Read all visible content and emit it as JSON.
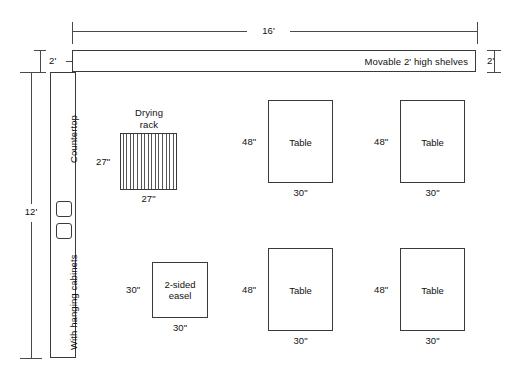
{
  "dimensions": {
    "room_width": "16'",
    "room_depth": "12'",
    "shelf_depth_left": "2'",
    "shelf_depth_right": "2'"
  },
  "shelves": {
    "label": "Movable 2' high shelves"
  },
  "countertop": {
    "top_label": "Countertop",
    "bottom_label": "With hanging cabinets",
    "sinks": [
      {
        "name": "sink-upper"
      },
      {
        "name": "sink-lower"
      }
    ]
  },
  "drying_rack": {
    "label_line1": "Drying",
    "label_line2": "rack",
    "height_label": "27\"",
    "width_label": "27\"",
    "stripe_count": 16
  },
  "furniture": [
    {
      "id": "table-top-left",
      "label": "Table",
      "height_label": "48\"",
      "width_label": "30\"",
      "x": 268,
      "y": 100,
      "w": 65,
      "h": 83
    },
    {
      "id": "table-top-right",
      "label": "Table",
      "height_label": "48\"",
      "width_label": "30\"",
      "x": 400,
      "y": 100,
      "w": 65,
      "h": 83
    },
    {
      "id": "easel-bottom-left",
      "label": "2-sided easel",
      "height_label": "30\"",
      "width_label": "30\"",
      "x": 152,
      "y": 262,
      "w": 56,
      "h": 56
    },
    {
      "id": "table-bottom-center",
      "label": "Table",
      "height_label": "48\"",
      "width_label": "30\"",
      "x": 268,
      "y": 248,
      "w": 65,
      "h": 83
    },
    {
      "id": "table-bottom-right",
      "label": "Table",
      "height_label": "48\"",
      "width_label": "30\"",
      "x": 400,
      "y": 248,
      "w": 65,
      "h": 83
    }
  ],
  "colors": {
    "line": "#3a3a3a",
    "dimension_line": "#4a4a4a",
    "text": "#111111",
    "background": "#ffffff"
  }
}
